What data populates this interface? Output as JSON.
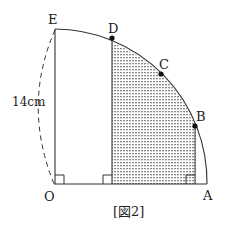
{
  "figure": {
    "caption": "[図2]",
    "points": {
      "O": "O",
      "A": "A",
      "B": "B",
      "C": "C",
      "D": "D",
      "E": "E"
    },
    "length_label": "14cm",
    "colors": {
      "line": "#333333",
      "shade": "#9a9a9a",
      "background": "#ffffff"
    }
  }
}
